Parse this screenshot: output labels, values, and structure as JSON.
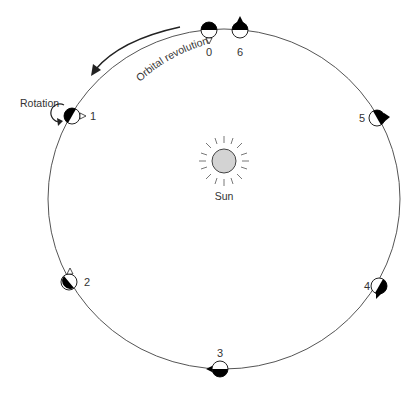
{
  "diagram": {
    "type": "orbit-rotation",
    "orbit": {
      "cx": 224,
      "cy": 199,
      "rx": 176,
      "ry": 170,
      "stroke": "#555555"
    },
    "sun": {
      "label": "Sun",
      "cx": 224,
      "cy": 161,
      "r": 12,
      "fill": "#d3d3d3"
    },
    "labels": {
      "orbital_revolution": "Orbital revolution",
      "rotation": "Rotation"
    },
    "positions": [
      {
        "id": "0",
        "label": "0"
      },
      {
        "id": "1",
        "label": "1"
      },
      {
        "id": "2",
        "label": "2"
      },
      {
        "id": "3",
        "label": "3"
      },
      {
        "id": "4",
        "label": "4"
      },
      {
        "id": "5",
        "label": "5"
      },
      {
        "id": "6",
        "label": "6"
      }
    ],
    "colors": {
      "dark_side": "#000000",
      "lit_side": "#ffffff",
      "line": "#333333"
    }
  }
}
